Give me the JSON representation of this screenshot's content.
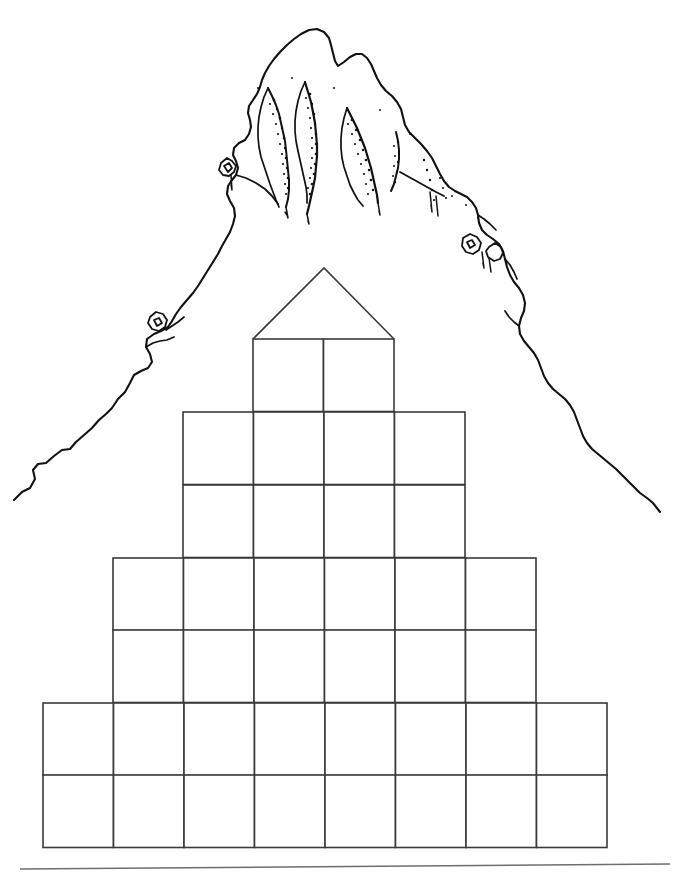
{
  "page": {
    "background_color": "#ffffff",
    "ink_color": "#1a1a1a",
    "width": 684,
    "height": 875
  },
  "illustration": {
    "name": "mountain-peak-line-drawing",
    "description": "Hand-drawn black-and-white line art of a rugged mountain summit with stippled ridge shading, slopes descending to the left and right behind the pyramid",
    "stroke_color": "#111111",
    "fill": "none",
    "summit_apex": {
      "x": 315,
      "y": 30
    },
    "left_base": {
      "x": 14,
      "y": 500
    },
    "right_base": {
      "x": 660,
      "y": 512
    }
  },
  "pyramid": {
    "name": "blank-goal-pyramid",
    "stroke_color": "#3a3a3a",
    "stroke_width": 1.6,
    "cell_width": 70.5,
    "row_height": 72.5,
    "apex": {
      "x": 324,
      "y": 268
    },
    "rows": [
      {
        "index": 1,
        "cells": 2,
        "left": 253,
        "top": 339,
        "cell_labels": [
          "",
          ""
        ]
      },
      {
        "index": 2,
        "cells": 4,
        "left": 183,
        "top": 412,
        "cell_labels": [
          "",
          "",
          "",
          ""
        ]
      },
      {
        "index": 3,
        "cells": 4,
        "left": 183,
        "top": 485,
        "cell_labels": [
          "",
          "",
          "",
          ""
        ]
      },
      {
        "index": 4,
        "cells": 6,
        "left": 113,
        "top": 558,
        "cell_labels": [
          "",
          "",
          "",
          "",
          "",
          ""
        ]
      },
      {
        "index": 5,
        "cells": 6,
        "left": 113,
        "top": 630,
        "cell_labels": [
          "",
          "",
          "",
          "",
          "",
          ""
        ]
      },
      {
        "index": 6,
        "cells": 8,
        "left": 43,
        "top": 703,
        "cell_labels": [
          "",
          "",
          "",
          "",
          "",
          "",
          "",
          ""
        ]
      },
      {
        "index": 7,
        "cells": 8,
        "left": 43,
        "top": 775,
        "cell_labels": [
          "",
          "",
          "",
          "",
          "",
          "",
          "",
          ""
        ]
      }
    ],
    "bottom": 848,
    "total_cells": 38
  },
  "footer_rule": {
    "name": "footer-divider-line",
    "x1": 20,
    "y1": 869,
    "x2": 670,
    "y2": 864,
    "color": "#6e6e6e"
  }
}
